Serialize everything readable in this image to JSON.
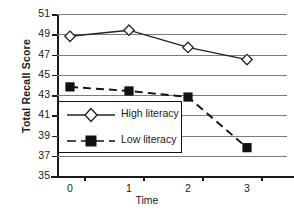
{
  "chart_data": {
    "type": "line",
    "title": "",
    "xlabel": "Time",
    "ylabel": "Total Recall Score",
    "x": [
      0,
      1,
      2,
      3
    ],
    "xticklabels": [
      "0",
      "1",
      "2",
      "3"
    ],
    "yticks": [
      35,
      37,
      39,
      41,
      43,
      45,
      47,
      49,
      51
    ],
    "yticklabels": [
      "35",
      "37",
      "39",
      "41",
      "43",
      "45",
      "47",
      "49",
      "51"
    ],
    "ylim": [
      35,
      51
    ],
    "grid": "horizontal",
    "legend_position": "center-left",
    "series": [
      {
        "name": "High literacy",
        "values": [
          48.8,
          49.4,
          47.7,
          46.5
        ],
        "marker": "open-diamond",
        "linestyle": "solid",
        "color": "#222222"
      },
      {
        "name": "Low literacy",
        "values": [
          43.8,
          43.4,
          42.8,
          37.8
        ],
        "marker": "filled-square",
        "linestyle": "dashed",
        "color": "#111111"
      }
    ]
  },
  "legend": {
    "entries": [
      {
        "label": "High literacy"
      },
      {
        "label": "Low literacy"
      }
    ]
  }
}
